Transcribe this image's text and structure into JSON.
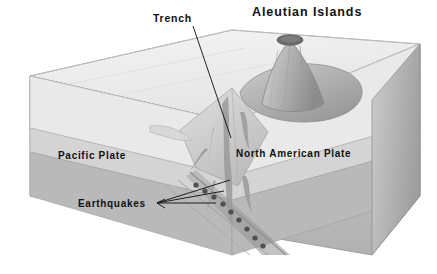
{
  "figure": {
    "title_text": "Aleutian Islands",
    "type": "geological block diagram"
  },
  "labels": {
    "aleutian_islands": "Aleutian Islands",
    "trench": "Trench",
    "pacific_plate": "Pacific Plate",
    "north_american_plate": "North American Plate",
    "earthquakes": "Earthquakes"
  },
  "colors": {
    "background": "#ffffff",
    "text": "#111111",
    "water_top": "#eeeeee",
    "water_top_shade": "#e2e2e2",
    "crust_band": "#d2d2d2",
    "mantle_body": "#b6b6b6",
    "mantle_dark": "#a0a0a0",
    "slab": "#9a9a9a",
    "volcano_light": "#c9c9c9",
    "volcano_dark": "#8f8f8f",
    "crater": "#6f6f6f",
    "quake_dot": "#4a4a4a",
    "outline": "#8a8a8a",
    "leader_line": "#0d0d0d"
  },
  "elements": {
    "volcano_crater": "crater",
    "earthquake_foci_count": 9,
    "magma_conduits": "branching magma plumes rising from slab to volcano",
    "leader_lines": {
      "trench": 1,
      "earthquakes": 3
    }
  },
  "earthquake_foci": [
    {
      "x": 196,
      "y": 185
    },
    {
      "x": 205,
      "y": 190
    },
    {
      "x": 215,
      "y": 196
    },
    {
      "x": 224,
      "y": 203
    },
    {
      "x": 232,
      "y": 211
    },
    {
      "x": 240,
      "y": 219
    },
    {
      "x": 248,
      "y": 228
    },
    {
      "x": 256,
      "y": 237
    },
    {
      "x": 264,
      "y": 245
    }
  ]
}
